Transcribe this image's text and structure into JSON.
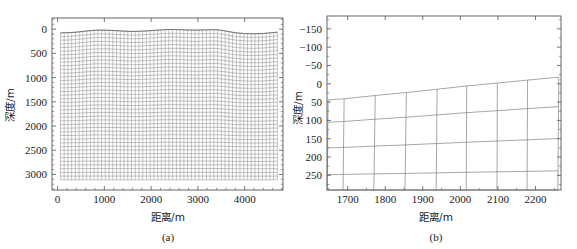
{
  "figure": {
    "background": "#ffffff",
    "line_color": "#707070",
    "axis_color": "#555555",
    "text_color": "#1a1a1a"
  },
  "chart_data": [
    {
      "type": "line",
      "panel": "a",
      "title": "",
      "caption": "(a)",
      "xlabel": "距离/m",
      "ylabel": "深度/m",
      "xticks": [
        0,
        1000,
        2000,
        3000,
        4000
      ],
      "yticks": [
        0,
        500,
        1000,
        1500,
        2000,
        2500,
        3000
      ],
      "xlim": [
        -120,
        4820
      ],
      "ylim": [
        3320,
        -230
      ],
      "y_inverted": true,
      "grid": false,
      "legend": null,
      "description": "Dense curvilinear finite-difference mesh of a subsurface velocity model with undulating free-surface topography",
      "mesh": {
        "n_columns": 58,
        "n_rows": 40,
        "x_start": 60,
        "x_end": 4700,
        "depth_top_base": 60,
        "depth_bottom": 3110,
        "topography": [
          {
            "x": 0,
            "z": 78
          },
          {
            "x": 200,
            "z": 74
          },
          {
            "x": 400,
            "z": 62
          },
          {
            "x": 600,
            "z": 40
          },
          {
            "x": 800,
            "z": 22
          },
          {
            "x": 1000,
            "z": 20
          },
          {
            "x": 1200,
            "z": 28
          },
          {
            "x": 1400,
            "z": 40
          },
          {
            "x": 1600,
            "z": 48
          },
          {
            "x": 1800,
            "z": 42
          },
          {
            "x": 2000,
            "z": 30
          },
          {
            "x": 2200,
            "z": 16
          },
          {
            "x": 2400,
            "z": 8
          },
          {
            "x": 2600,
            "z": 10
          },
          {
            "x": 2800,
            "z": 18
          },
          {
            "x": 3000,
            "z": 20
          },
          {
            "x": 3200,
            "z": 14
          },
          {
            "x": 3400,
            "z": 10
          },
          {
            "x": 3600,
            "z": 40
          },
          {
            "x": 3800,
            "z": 76
          },
          {
            "x": 4000,
            "z": 92
          },
          {
            "x": 4200,
            "z": 96
          },
          {
            "x": 4400,
            "z": 90
          },
          {
            "x": 4600,
            "z": 72
          },
          {
            "x": 4700,
            "z": 62
          }
        ]
      }
    },
    {
      "type": "line",
      "panel": "b",
      "title": "",
      "caption": "(b)",
      "xlabel": "距离/m",
      "ylabel": "深度/m",
      "xticks": [
        1700,
        1800,
        1900,
        2000,
        2100,
        2200
      ],
      "yticks": [
        -150,
        -100,
        -50,
        0,
        50,
        100,
        150,
        200,
        250
      ],
      "xlim": [
        1645,
        2268
      ],
      "ylim": [
        290,
        -185
      ],
      "y_inverted": true,
      "grid": false,
      "legend": null,
      "description": "Magnified view of the curvilinear mesh near the surface between 1645 m and 2268 m showing individual cells following topography",
      "mesh": {
        "n_columns": 9,
        "n_rows": 5,
        "x_start": 1648,
        "x_end": 2265,
        "vertical_lines_x": [
          1648,
          1690,
          1772,
          1855,
          1938,
          2018,
          2100,
          2180,
          2262
        ],
        "surface": [
          {
            "x": 1648,
            "z": 44
          },
          {
            "x": 1690,
            "z": 41
          },
          {
            "x": 1772,
            "z": 32
          },
          {
            "x": 1855,
            "z": 24
          },
          {
            "x": 1938,
            "z": 15
          },
          {
            "x": 2018,
            "z": 6
          },
          {
            "x": 2100,
            "z": -2
          },
          {
            "x": 2180,
            "z": -10
          },
          {
            "x": 2262,
            "z": -18
          }
        ],
        "horizon_depths": [
          44,
          105,
          175,
          248,
          290
        ]
      }
    }
  ],
  "panel_a": {
    "caption": "(a)",
    "xlabel": "距离/m",
    "ylabel": "深度/m",
    "xticks": [
      "0",
      "1000",
      "2000",
      "3000",
      "4000"
    ],
    "yticks": [
      "0",
      "500",
      "1000",
      "1500",
      "2000",
      "2500",
      "3000"
    ]
  },
  "panel_b": {
    "caption": "(b)",
    "xlabel": "距离/m",
    "ylabel": "深度/m",
    "xticks": [
      "1700",
      "1800",
      "1900",
      "2000",
      "2100",
      "2200"
    ],
    "yticks": [
      "−150",
      "−100",
      "−50",
      "0",
      "50",
      "100",
      "150",
      "200",
      "250"
    ]
  }
}
